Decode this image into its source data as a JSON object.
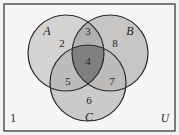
{
  "figure": {
    "name": "three-set-venn-diagram",
    "universe_label": "U",
    "outside_count_label": "1",
    "background_color": "#f3f2f0",
    "outline_color": "#2b2b2b",
    "sets": [
      {
        "id": "A",
        "label": "A",
        "cx": 66,
        "cy": 53,
        "r": 38
      },
      {
        "id": "B",
        "label": "B",
        "cx": 110,
        "cy": 53,
        "r": 38
      },
      {
        "id": "C",
        "label": "C",
        "cx": 88,
        "cy": 83,
        "r": 38
      }
    ],
    "set_label_positions": [
      {
        "id": "A",
        "x": 47,
        "y": 32
      },
      {
        "id": "B",
        "x": 130,
        "y": 32
      },
      {
        "id": "C",
        "x": 89,
        "y": 118
      }
    ],
    "regions": [
      {
        "id": "A-only",
        "label": "2",
        "x": 62,
        "y": 44,
        "fill": "#d4d3d1"
      },
      {
        "id": "A-and-B",
        "label": "3",
        "x": 88,
        "y": 32,
        "fill": "#b2b1af"
      },
      {
        "id": "B-only",
        "label": "8",
        "x": 115,
        "y": 44,
        "fill": "#c7c6c4"
      },
      {
        "id": "A-B-C",
        "label": "4",
        "x": 88,
        "y": 62,
        "fill": "#807f7d"
      },
      {
        "id": "A-and-C",
        "label": "5",
        "x": 68,
        "y": 82,
        "fill": "#bdbcba"
      },
      {
        "id": "B-and-C",
        "label": "7",
        "x": 112,
        "y": 82,
        "fill": "#bdbcba"
      },
      {
        "id": "C-only",
        "label": "6",
        "x": 89,
        "y": 101,
        "fill": "#cbcac8"
      }
    ],
    "corner_labels": [
      {
        "id": "outside-count",
        "label": "1",
        "x": 13,
        "y": 119,
        "italic": false
      },
      {
        "id": "universe",
        "label": "U",
        "x": 165,
        "y": 119,
        "italic": true
      }
    ],
    "frame": {
      "x": 4,
      "y": 4,
      "width": 171,
      "height": 127
    }
  }
}
